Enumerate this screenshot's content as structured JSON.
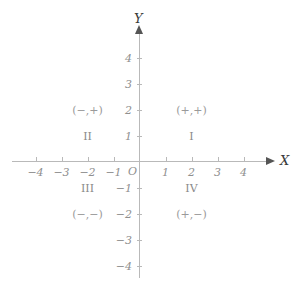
{
  "figure": {
    "type": "cartesian-coordinate-plane",
    "background_color": "#ffffff",
    "axis_color": "#b9b9b9",
    "label_color": "#8f8f8f"
  },
  "axes": {
    "x": {
      "name": "X",
      "tick_labels": [
        "−4",
        "−3",
        "−2",
        "−1",
        "1",
        "2",
        "3",
        "4"
      ],
      "tick_values": [
        -4,
        -3,
        -2,
        -1,
        1,
        2,
        3,
        4
      ],
      "range": [
        -4.8,
        4.9
      ],
      "arrow": "right"
    },
    "y": {
      "name": "Y",
      "tick_labels": [
        "4",
        "3",
        "2",
        "1",
        "−1",
        "−2",
        "−3",
        "−4"
      ],
      "tick_values": [
        4,
        3,
        2,
        1,
        -1,
        -2,
        -3,
        -4
      ],
      "range": [
        -4.4,
        5.0
      ],
      "arrow": "up"
    },
    "origin_label": "O"
  },
  "quadrants": [
    {
      "numeral": "I",
      "signs": "(+,+)",
      "signs_position": {
        "x": 2,
        "y": 2
      },
      "numeral_position": {
        "x": 2,
        "y": 1
      }
    },
    {
      "numeral": "II",
      "signs": "(−,+)",
      "signs_position": {
        "x": -2,
        "y": 2
      },
      "numeral_position": {
        "x": -2,
        "y": 1
      }
    },
    {
      "numeral": "III",
      "signs": "(−,−)",
      "numeral_position": {
        "x": -2,
        "y": -1
      },
      "signs_position": {
        "x": -2,
        "y": -2
      }
    },
    {
      "numeral": "IV",
      "signs": "(+,−)",
      "numeral_position": {
        "x": 2,
        "y": -1
      },
      "signs_position": {
        "x": 2,
        "y": -2
      }
    }
  ],
  "chart_data": {
    "type": "scatter",
    "title": "",
    "xlabel": "X",
    "ylabel": "Y",
    "xlim": [
      -4.8,
      4.9
    ],
    "ylim": [
      -4.4,
      5.0
    ],
    "xticks": [
      -4,
      -3,
      -2,
      -1,
      1,
      2,
      3,
      4
    ],
    "yticks": [
      -4,
      -3,
      -2,
      -1,
      1,
      2,
      3,
      4
    ],
    "grid": false,
    "legend": "none",
    "series": [],
    "annotations": [
      {
        "text": "(+,+)",
        "x": 2,
        "y": 2
      },
      {
        "text": "I",
        "x": 2,
        "y": 1
      },
      {
        "text": "(−,+)",
        "x": -2,
        "y": 2
      },
      {
        "text": "II",
        "x": -2,
        "y": 1
      },
      {
        "text": "III",
        "x": -2,
        "y": -1
      },
      {
        "text": "(−,−)",
        "x": -2,
        "y": -2
      },
      {
        "text": "IV",
        "x": 2,
        "y": -1
      },
      {
        "text": "(+,−)",
        "x": 2,
        "y": -2
      },
      {
        "text": "O",
        "x": 0,
        "y": 0
      }
    ]
  }
}
